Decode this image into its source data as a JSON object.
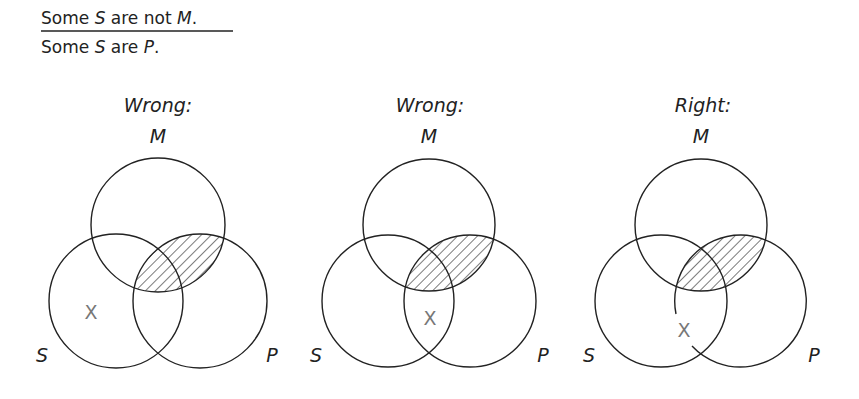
{
  "syllogism": {
    "premise": [
      "Some ",
      "S",
      " are not ",
      "M",
      "."
    ],
    "conclusion": [
      "Some ",
      "S",
      " are ",
      "P",
      "."
    ]
  },
  "diagrams": [
    {
      "title": "Wrong:",
      "labels": {
        "M": "M",
        "S": "S",
        "P": "P"
      },
      "cx": 158,
      "x_mark": {
        "text": "X",
        "x": 116,
        "y": 312
      },
      "shaded": "M∩P"
    },
    {
      "title": "Wrong:",
      "labels": {
        "M": "M",
        "S": "S",
        "P": "P"
      },
      "cx": 429,
      "x_mark": {
        "text": "X",
        "x": 429,
        "y": 320
      },
      "shaded": "M∩P"
    },
    {
      "title": "Right:",
      "labels": {
        "M": "M",
        "S": "S",
        "P": "P"
      },
      "cx": 701,
      "x_mark": {
        "text": "X",
        "x": 683,
        "y": 336
      },
      "shaded": "M∩P",
      "note": "X placed on the P circle boundary"
    }
  ],
  "colors": {
    "stroke": "#222222",
    "x_mark": "#777777",
    "background": "#ffffff"
  }
}
